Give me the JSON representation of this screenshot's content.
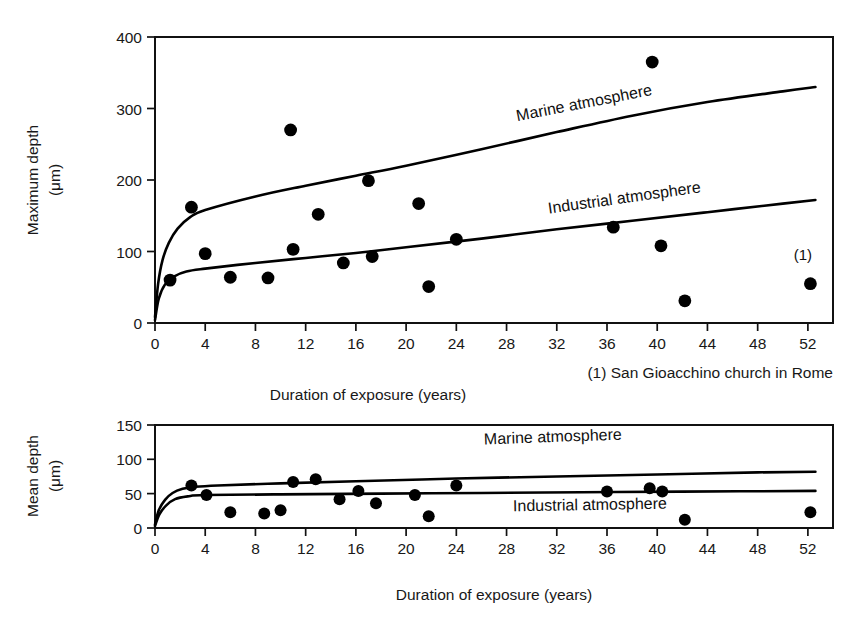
{
  "figure": {
    "background": "#ffffff",
    "ink_color": "#000000"
  },
  "chart_data": [
    {
      "type": "scatter",
      "id": "maximum-depth-chart",
      "title": "",
      "xlabel": "Duration of exposure (years)",
      "ylabel": "Maximum depth (μm)",
      "ylabel_line1": "Maximum depth",
      "ylabel_line2": "(μm)",
      "xlim": [
        0,
        54
      ],
      "ylim": [
        0,
        400
      ],
      "xticks": [
        0,
        4,
        8,
        12,
        16,
        20,
        24,
        28,
        32,
        36,
        40,
        44,
        48,
        52
      ],
      "yticks": [
        0,
        100,
        200,
        300,
        400
      ],
      "grid": false,
      "legend_position": "inline-curve-labels",
      "points": [
        {
          "x": 1.2,
          "y": 60
        },
        {
          "x": 2.9,
          "y": 162
        },
        {
          "x": 4.0,
          "y": 97
        },
        {
          "x": 6.0,
          "y": 64
        },
        {
          "x": 9.0,
          "y": 63
        },
        {
          "x": 10.8,
          "y": 270
        },
        {
          "x": 11.0,
          "y": 103
        },
        {
          "x": 13.0,
          "y": 152
        },
        {
          "x": 15.0,
          "y": 84
        },
        {
          "x": 17.0,
          "y": 199
        },
        {
          "x": 17.3,
          "y": 93
        },
        {
          "x": 21.0,
          "y": 167
        },
        {
          "x": 21.8,
          "y": 51
        },
        {
          "x": 24.0,
          "y": 117
        },
        {
          "x": 36.5,
          "y": 134
        },
        {
          "x": 39.6,
          "y": 365
        },
        {
          "x": 40.3,
          "y": 108
        },
        {
          "x": 42.2,
          "y": 31
        },
        {
          "x": 52.2,
          "y": 55
        }
      ],
      "curves": [
        {
          "name": "Marine atmosphere",
          "label": "Marine atmosphere",
          "label_rotation": -11,
          "points": [
            {
              "x": 0.0,
              "y": 8
            },
            {
              "x": 0.25,
              "y": 55
            },
            {
              "x": 0.6,
              "y": 88
            },
            {
              "x": 1.1,
              "y": 112
            },
            {
              "x": 1.8,
              "y": 132
            },
            {
              "x": 2.8,
              "y": 148
            },
            {
              "x": 4.0,
              "y": 158
            },
            {
              "x": 8.0,
              "y": 177
            },
            {
              "x": 12.0,
              "y": 192
            },
            {
              "x": 16.0,
              "y": 206
            },
            {
              "x": 20.0,
              "y": 220
            },
            {
              "x": 26.0,
              "y": 243
            },
            {
              "x": 32.0,
              "y": 267
            },
            {
              "x": 38.0,
              "y": 290
            },
            {
              "x": 44.0,
              "y": 309
            },
            {
              "x": 50.0,
              "y": 324
            },
            {
              "x": 52.6,
              "y": 330
            }
          ]
        },
        {
          "name": "Industrial atmosphere",
          "label": "Industrial atmosphere",
          "label_rotation": -8,
          "points": [
            {
              "x": 0.0,
              "y": 4
            },
            {
              "x": 0.3,
              "y": 34
            },
            {
              "x": 0.8,
              "y": 54
            },
            {
              "x": 1.5,
              "y": 65
            },
            {
              "x": 2.5,
              "y": 72
            },
            {
              "x": 4.0,
              "y": 76
            },
            {
              "x": 8.0,
              "y": 84
            },
            {
              "x": 12.0,
              "y": 91
            },
            {
              "x": 16.0,
              "y": 98
            },
            {
              "x": 20.0,
              "y": 106
            },
            {
              "x": 26.0,
              "y": 118
            },
            {
              "x": 32.0,
              "y": 131
            },
            {
              "x": 38.0,
              "y": 143
            },
            {
              "x": 44.0,
              "y": 155
            },
            {
              "x": 50.0,
              "y": 167
            },
            {
              "x": 52.6,
              "y": 172
            }
          ]
        }
      ],
      "annotations": [
        {
          "text": "(1)",
          "x": 51.6,
          "y": 88
        }
      ],
      "footnote": "(1) San Gioacchino church in Rome"
    },
    {
      "type": "scatter",
      "id": "mean-depth-chart",
      "title": "",
      "xlabel": "Duration of exposure (years)",
      "ylabel": "Mean depth (μm)",
      "ylabel_line1": "Mean depth",
      "ylabel_line2": "(μm)",
      "xlim": [
        0,
        54
      ],
      "ylim": [
        0,
        150
      ],
      "xticks": [
        0,
        4,
        8,
        12,
        16,
        20,
        24,
        28,
        32,
        36,
        40,
        44,
        48,
        52
      ],
      "yticks": [
        0,
        50,
        100,
        150
      ],
      "grid": false,
      "legend_position": "inline-curve-labels",
      "points": [
        {
          "x": 2.9,
          "y": 62
        },
        {
          "x": 4.1,
          "y": 48
        },
        {
          "x": 6.0,
          "y": 23
        },
        {
          "x": 8.7,
          "y": 21
        },
        {
          "x": 10.0,
          "y": 26
        },
        {
          "x": 11.0,
          "y": 67
        },
        {
          "x": 12.8,
          "y": 71
        },
        {
          "x": 14.7,
          "y": 42
        },
        {
          "x": 16.2,
          "y": 54
        },
        {
          "x": 17.6,
          "y": 36
        },
        {
          "x": 20.7,
          "y": 48
        },
        {
          "x": 21.8,
          "y": 17
        },
        {
          "x": 24.0,
          "y": 62
        },
        {
          "x": 36.0,
          "y": 53
        },
        {
          "x": 39.4,
          "y": 58
        },
        {
          "x": 40.4,
          "y": 53
        },
        {
          "x": 42.2,
          "y": 12
        },
        {
          "x": 52.2,
          "y": 23
        }
      ],
      "curves": [
        {
          "name": "Marine atmosphere",
          "label": "Marine atmosphere",
          "label_rotation": -2,
          "points": [
            {
              "x": 0.0,
              "y": 5
            },
            {
              "x": 0.3,
              "y": 26
            },
            {
              "x": 0.8,
              "y": 41
            },
            {
              "x": 1.4,
              "y": 51
            },
            {
              "x": 2.2,
              "y": 57
            },
            {
              "x": 3.2,
              "y": 60
            },
            {
              "x": 5.0,
              "y": 62
            },
            {
              "x": 10.0,
              "y": 65
            },
            {
              "x": 16.0,
              "y": 68
            },
            {
              "x": 24.0,
              "y": 72
            },
            {
              "x": 32.0,
              "y": 75
            },
            {
              "x": 40.0,
              "y": 78
            },
            {
              "x": 48.0,
              "y": 81
            },
            {
              "x": 52.6,
              "y": 82
            }
          ]
        },
        {
          "name": "Industrial atmosphere",
          "label": "Industrial atmosphere",
          "label_rotation": -1,
          "points": [
            {
              "x": 0.0,
              "y": 3
            },
            {
              "x": 0.35,
              "y": 20
            },
            {
              "x": 0.9,
              "y": 33
            },
            {
              "x": 1.6,
              "y": 42
            },
            {
              "x": 2.6,
              "y": 46
            },
            {
              "x": 4.0,
              "y": 48
            },
            {
              "x": 10.0,
              "y": 49
            },
            {
              "x": 18.0,
              "y": 50
            },
            {
              "x": 26.0,
              "y": 51
            },
            {
              "x": 34.0,
              "y": 52
            },
            {
              "x": 42.0,
              "y": 53
            },
            {
              "x": 52.6,
              "y": 54
            }
          ]
        }
      ],
      "annotations": [],
      "footnote": ""
    }
  ]
}
